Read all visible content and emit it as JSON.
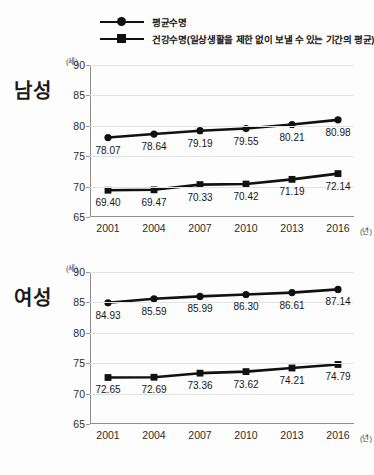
{
  "legend": {
    "items": [
      {
        "label": "평균수명",
        "marker": "circle-marker"
      },
      {
        "label": "건강수명(일상생활을 제한 없이 보낼 수 있는 기간의 평균)",
        "marker": "square-marker"
      }
    ]
  },
  "panels": [
    {
      "side_label": "남성",
      "unit_y": "(세)",
      "unit_x": "(년)",
      "y_ticks": [
        "90",
        "85",
        "80",
        "75",
        "70",
        "65"
      ],
      "x_ticks": [
        "2001",
        "2004",
        "2007",
        "2010",
        "2013",
        "2016"
      ],
      "series": [
        {
          "name": "평균수명",
          "labels": [
            "78.07",
            "78.64",
            "79.19",
            "79.55",
            "80.21",
            "80.98"
          ]
        },
        {
          "name": "건강수명",
          "labels": [
            "69.40",
            "69.47",
            "70.33",
            "70.42",
            "71.19",
            "72.14"
          ]
        }
      ]
    },
    {
      "side_label": "여성",
      "unit_y": "(세)",
      "unit_x": "(년)",
      "y_ticks": [
        "90",
        "85",
        "80",
        "75",
        "70",
        "65"
      ],
      "x_ticks": [
        "2001",
        "2004",
        "2007",
        "2010",
        "2013",
        "2016"
      ],
      "series": [
        {
          "name": "평균수명",
          "labels": [
            "84.93",
            "85.59",
            "85.99",
            "86.30",
            "86.61",
            "87.14"
          ]
        },
        {
          "name": "건강수명",
          "labels": [
            "72.65",
            "72.69",
            "73.36",
            "73.62",
            "74.21",
            "74.79"
          ]
        }
      ]
    }
  ],
  "chart_data": [
    {
      "type": "line",
      "title": "남성",
      "xlabel": "(년)",
      "ylabel": "(세)",
      "x": [
        2001,
        2004,
        2007,
        2010,
        2013,
        2016
      ],
      "categories": [
        "2001",
        "2004",
        "2007",
        "2010",
        "2013",
        "2016"
      ],
      "ylim": [
        65,
        90
      ],
      "yticks": [
        65,
        70,
        75,
        80,
        85,
        90
      ],
      "grid": true,
      "legend_position": "top",
      "series": [
        {
          "name": "평균수명",
          "marker": "circle",
          "values": [
            78.07,
            78.64,
            79.19,
            79.55,
            80.21,
            80.98
          ]
        },
        {
          "name": "건강수명(일상생활을 제한 없이 보낼 수 있는 기간의 평균)",
          "marker": "square",
          "values": [
            69.4,
            69.47,
            70.33,
            70.42,
            71.19,
            72.14
          ]
        }
      ]
    },
    {
      "type": "line",
      "title": "여성",
      "xlabel": "(년)",
      "ylabel": "(세)",
      "x": [
        2001,
        2004,
        2007,
        2010,
        2013,
        2016
      ],
      "categories": [
        "2001",
        "2004",
        "2007",
        "2010",
        "2013",
        "2016"
      ],
      "ylim": [
        65,
        90
      ],
      "yticks": [
        65,
        70,
        75,
        80,
        85,
        90
      ],
      "grid": true,
      "legend_position": "top",
      "series": [
        {
          "name": "평균수명",
          "marker": "circle",
          "values": [
            84.93,
            85.59,
            85.99,
            86.3,
            86.61,
            87.14
          ]
        },
        {
          "name": "건강수명(일상생활을 제한 없이 보낼 수 있는 기간의 평균)",
          "marker": "square",
          "values": [
            72.65,
            72.69,
            73.36,
            73.62,
            74.21,
            74.79
          ]
        }
      ]
    }
  ]
}
